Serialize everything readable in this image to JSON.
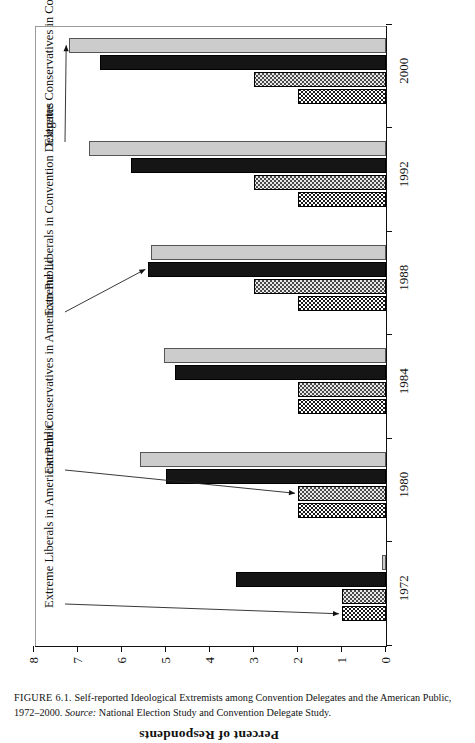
{
  "figure": {
    "caption_number": "FIGURE 6.1.",
    "caption_title": "Self-reported Ideological Extremists among Convention Delegates and the American Public, 1972–2000.",
    "caption_source_label": "Source:",
    "caption_source_text": "National Election Study and Convention Delegate Study."
  },
  "chart_data": {
    "type": "bar",
    "title": "",
    "xlabel": "",
    "ylabel": "Percent of Respondents",
    "ylim": [
      0,
      8
    ],
    "yticks": [
      0,
      1,
      2,
      3,
      4,
      5,
      6,
      7,
      8
    ],
    "ytick_labels": [
      "0",
      "1",
      "2",
      "3",
      "4",
      "5",
      "6",
      "7",
      "8"
    ],
    "grid": false,
    "legend_position": "none",
    "orientation": "vertical-bars-printed-sideways",
    "categories": [
      "1972",
      "1980",
      "1984",
      "1988",
      "1992",
      "2000"
    ],
    "series": [
      {
        "name": "Extreme Liberals in American Public",
        "pattern": "dark-checkered",
        "color": "#1a1a1a",
        "values": [
          1.0,
          2.0,
          2.0,
          2.0,
          2.0,
          2.0
        ]
      },
      {
        "name": "Extreme Conservatives in American Public",
        "pattern": "light-dotted",
        "color": "#e8e8e8",
        "values": [
          1.0,
          2.0,
          2.0,
          3.0,
          3.0,
          3.0
        ]
      },
      {
        "name": "Extreme Liberals in Convention Delegates",
        "pattern": "solid-black",
        "color": "#151515",
        "values": [
          3.4,
          5.0,
          4.8,
          5.4,
          5.8,
          6.5
        ]
      },
      {
        "name": "Extreme Conservatives in Convention Delegates",
        "pattern": "light-gray",
        "color": "#cccccc",
        "values": [
          0.1,
          5.6,
          5.05,
          5.35,
          6.75,
          7.2
        ]
      }
    ],
    "annotations": [
      {
        "text": "Extreme Liberals in American Public",
        "points_to": {
          "series": "Extreme Liberals in American Public",
          "category": "1972"
        }
      },
      {
        "text": "Extreme Conservatives in American Public",
        "points_to": {
          "series": "Extreme Conservatives in American Public",
          "category": "1980"
        }
      },
      {
        "text": "Extreme Liberals in Convention Delegates",
        "points_to": {
          "series": "Extreme Liberals in Convention Delegates",
          "category": "1988"
        }
      },
      {
        "text": "Extreme Conservatives in Convention Delegates",
        "points_to": {
          "series": "Extreme Conservatives in Convention Delegates",
          "category": "2000"
        }
      }
    ]
  }
}
